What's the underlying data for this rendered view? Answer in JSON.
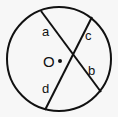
{
  "diagram": {
    "type": "geometry-circle-intersecting-chords",
    "circle": {
      "cx": 59,
      "cy": 59,
      "r": 52,
      "stroke": "#111111"
    },
    "center": {
      "label": "O",
      "x": 60,
      "y": 61
    },
    "chords": [
      {
        "name": "chord-ab",
        "x1": 41,
        "y1": 11,
        "x2": 101,
        "y2": 92
      },
      {
        "name": "chord-cd",
        "x1": 92,
        "y1": 17,
        "x2": 45,
        "y2": 110
      }
    ],
    "segment_labels": [
      {
        "text": "a",
        "x": 42,
        "y": 36
      },
      {
        "text": "c",
        "x": 85,
        "y": 40
      },
      {
        "text": "b",
        "x": 88,
        "y": 75
      },
      {
        "text": "d",
        "x": 42,
        "y": 93
      }
    ],
    "center_label": {
      "text": "O",
      "x": 43,
      "y": 67
    }
  }
}
